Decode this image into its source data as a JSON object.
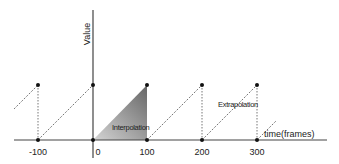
{
  "diagram": {
    "y_axis_label": "Value",
    "x_axis_label": "time(frames)",
    "tick_labels": [
      "-100",
      "0",
      "100",
      "200",
      "300"
    ],
    "annotations": {
      "interpolation": "Interpolation",
      "extrapolation": "Extrapolation"
    },
    "colors": {
      "axis": "#444444",
      "dot": "#111111",
      "dashed": "#666666",
      "fill_light": "#cfcfcf",
      "fill_dark": "#6e6e6e"
    }
  }
}
